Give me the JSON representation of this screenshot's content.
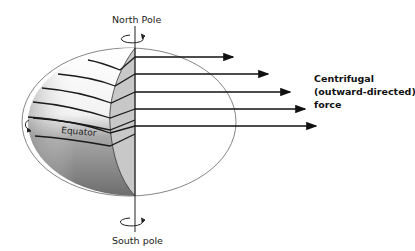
{
  "diagram": {
    "labels": {
      "north_pole": "North Pole",
      "south_pole": "South pole",
      "equator": "Equator",
      "force_line1": "Centrifugal",
      "force_line2": "(outward-directed)",
      "force_line3": "force"
    },
    "arrows": [
      {
        "name": "force-arrow-1"
      },
      {
        "name": "force-arrow-2"
      },
      {
        "name": "force-arrow-3"
      },
      {
        "name": "force-arrow-4"
      },
      {
        "name": "force-arrow-5"
      }
    ],
    "colors": {
      "outline": "#777777",
      "lines": "#1a1a1a",
      "cutaway": "#c8c8c8",
      "shading": "#8a8a8a"
    }
  }
}
